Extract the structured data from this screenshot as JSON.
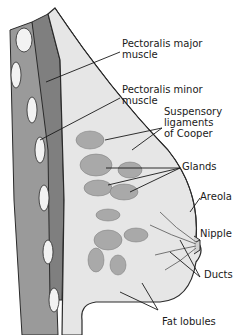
{
  "diagram": {
    "labels": [
      {
        "id": "pectoralis-major",
        "line1": "Pectoralis major",
        "line2": "muscle"
      },
      {
        "id": "pectoralis-minor",
        "line1": "Pectoralis minor",
        "line2": "muscle"
      },
      {
        "id": "suspensory-ligaments",
        "line1": "Suspensory",
        "line2": "ligaments",
        "line3": "of Cooper"
      },
      {
        "id": "glands",
        "line1": "Glands"
      },
      {
        "id": "areola",
        "line1": "Areola"
      },
      {
        "id": "nipple",
        "line1": "Nipple"
      },
      {
        "id": "ducts",
        "line1": "Ducts"
      },
      {
        "id": "fat-lobules",
        "line1": "Fat lobules"
      }
    ],
    "colors": {
      "background": "#ffffff",
      "outline": "#2a2a2a",
      "muscle": "#8c8c8c",
      "tissue": "#e4e4e4",
      "gland": "#a9a9a9",
      "rib": "#f2f2f2"
    }
  }
}
